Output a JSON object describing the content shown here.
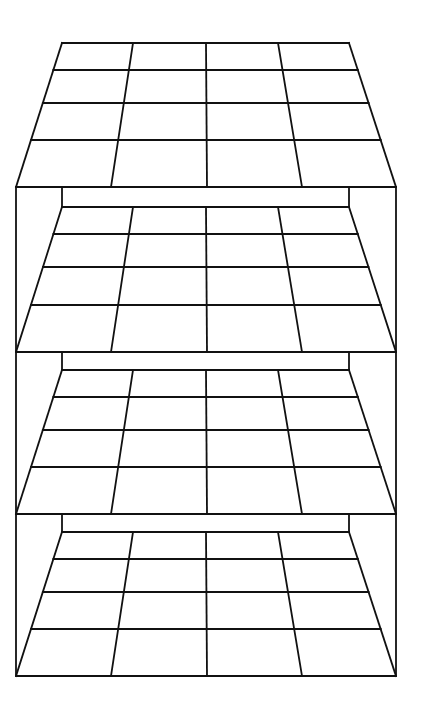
{
  "diagram": {
    "title": "",
    "stroke_color": "#111111",
    "background": "#ffffff",
    "grid": {
      "columns": 4,
      "rows": 4
    },
    "back_edge": {
      "x_left": 62,
      "x_right": 349
    },
    "front_edge": {
      "x_left": 16,
      "x_right": 396
    },
    "frame": {
      "x_left": 16,
      "x_right": 396,
      "y_top": 187,
      "y_bottom": 676
    },
    "back_columns_x": [
      62,
      133,
      206,
      278,
      349
    ],
    "front_columns_x": [
      16,
      111,
      207,
      302,
      396
    ],
    "levels": [
      {
        "name": "top-roof",
        "back_wall_top": null,
        "floor_top": 43,
        "row_lines": [
          70,
          103,
          140
        ],
        "floor_bottom": 187
      },
      {
        "name": "shelf-1",
        "back_wall_top": 187,
        "floor_top": 207,
        "row_lines": [
          234,
          267,
          305
        ],
        "floor_bottom": 352
      },
      {
        "name": "shelf-2",
        "back_wall_top": 352,
        "floor_top": 370,
        "row_lines": [
          397,
          430,
          467
        ],
        "floor_bottom": 514
      },
      {
        "name": "shelf-3",
        "back_wall_top": 514,
        "floor_top": 532,
        "row_lines": [
          559,
          592,
          629
        ],
        "floor_bottom": 676
      }
    ]
  }
}
